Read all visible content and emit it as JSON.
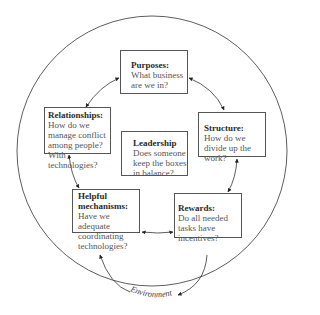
{
  "diagram": {
    "boxes": {
      "purposes": {
        "title": "Purposes:",
        "body": "What business are we in?"
      },
      "structure": {
        "title": "Structure:",
        "body": "How do we divide up the work?"
      },
      "rewards": {
        "title": "Rewards:",
        "body": "Do all needed tasks have incentives?"
      },
      "helpful": {
        "title": "Helpful mechanisms:",
        "body": "Have we adequate coordinating technologies?"
      },
      "relationships": {
        "title": "Relationships:",
        "body": "How do we manage conflict among people? With technologies?"
      },
      "leadership": {
        "title": "Leadership",
        "body": "Does someone keep the boxes in balance?"
      }
    },
    "environment_label": "Environment",
    "colors": {
      "line": "#333333",
      "box_border": "#555555",
      "text": "#3a3a3a"
    }
  }
}
